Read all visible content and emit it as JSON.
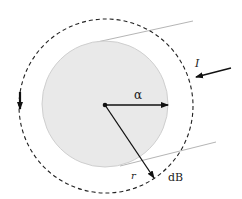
{
  "diagram": {
    "labels": {
      "current": "I",
      "radius_wire": "α",
      "distance": "r",
      "field_element": "dB"
    },
    "colors": {
      "wire_fill": "#e8e8e8",
      "wire_edge": "#c8c8c8",
      "stroke": "#111111",
      "guide": "#b0b0b0"
    }
  }
}
